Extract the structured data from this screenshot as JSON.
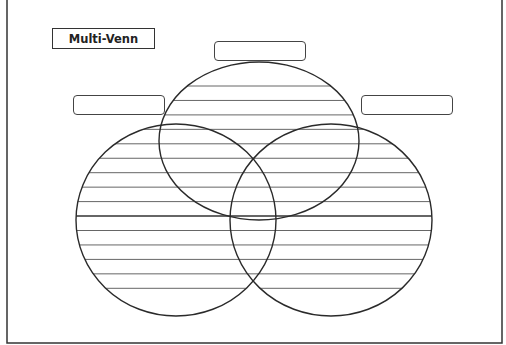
{
  "worksheet": {
    "title": "Multi-Venn",
    "labels": {
      "top": "",
      "left": "",
      "right": ""
    },
    "circle_count": 3,
    "writing_lines_per_region": "ruled",
    "colors": {
      "stroke": "#333333",
      "ruled_line": "#555555",
      "background": "#ffffff"
    }
  }
}
